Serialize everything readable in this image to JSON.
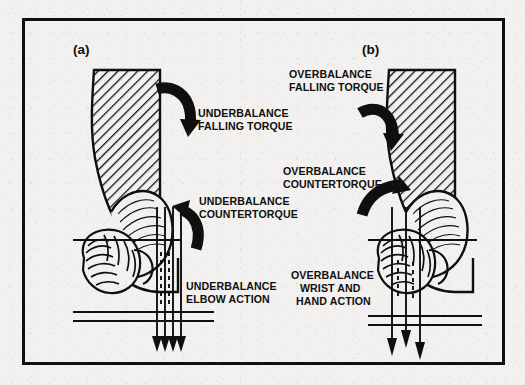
{
  "figure": {
    "background_color": "#f2f1ef",
    "ink_color": "#100f0d",
    "border": {
      "name": "figure-border",
      "x": 22,
      "y": 18,
      "width": 483,
      "height": 347,
      "stroke_width": 3
    },
    "panels": [
      {
        "id": "a",
        "tag": "(a)",
        "tag_x": 73,
        "tag_y": 54,
        "condition": "underbalance",
        "callouts": [
          {
            "name": "underbalance-falling-torque",
            "lines": [
              "UNDERBALANCE",
              "FALLING TORQUE"
            ],
            "x": 198,
            "y": 117,
            "anchor": "start"
          },
          {
            "name": "underbalance-countertorque",
            "lines": [
              "UNDERBALANCE",
              "COUNTERTORQUE"
            ],
            "x": 199,
            "y": 205,
            "anchor": "start"
          },
          {
            "name": "underbalance-elbow-action",
            "lines": [
              "UNDERBALANCE",
              "ELBOW ACTION"
            ],
            "x": 186,
            "y": 290,
            "anchor": "start"
          }
        ],
        "arrows": [
          {
            "name": "falling-torque-arrow",
            "direction": "down-right"
          },
          {
            "name": "countertorque-arrow",
            "direction": "up-left"
          }
        ],
        "force_arrows_count": 4,
        "force_arrow_style": "converging-to-single-point"
      },
      {
        "id": "b",
        "tag": "(b)",
        "tag_x": 362,
        "tag_y": 54,
        "condition": "overbalance",
        "callouts": [
          {
            "name": "overbalance-falling-torque",
            "lines": [
              "OVERBALANCE",
              "FALLING TORQUE"
            ],
            "x": 289,
            "y": 78,
            "anchor": "start"
          },
          {
            "name": "overbalance-countertorque",
            "lines": [
              "OVERBALANCE",
              "COUNTERTORQUE"
            ],
            "x": 283,
            "y": 175,
            "anchor": "start"
          },
          {
            "name": "overbalance-wrist-and-hand-action",
            "lines": [
              "OVERBALANCE",
              "WRIST AND",
              "HAND ACTION"
            ],
            "x": 291,
            "y": 279,
            "anchor": "start"
          }
        ],
        "arrows": [
          {
            "name": "falling-torque-arrow",
            "direction": "down-right"
          },
          {
            "name": "countertorque-arrow",
            "direction": "up-right"
          }
        ],
        "force_arrows_count": 3,
        "force_arrow_style": "parallel-staggered-arrowheads"
      }
    ],
    "illustration": {
      "description": "hatched forearm with clenched fist gripping a bar, shown in two balance conditions",
      "hatch_angle_deg": 45
    }
  }
}
